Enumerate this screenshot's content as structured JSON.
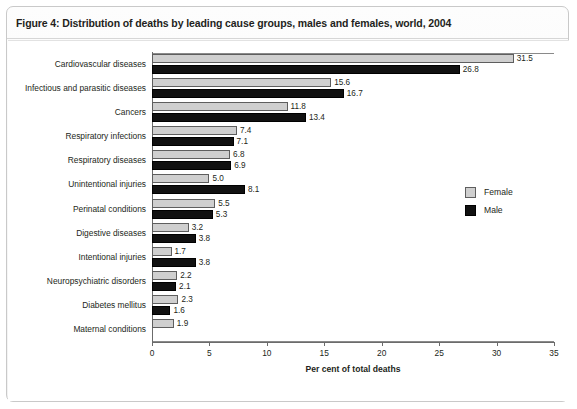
{
  "figure": {
    "title": "Figure 4: Distribution of deaths by leading cause groups, males and females, world, 2004"
  },
  "legend": {
    "items": [
      {
        "label": "Female",
        "key": "female",
        "color": "#cfcfcf"
      },
      {
        "label": "Male",
        "key": "male",
        "color": "#111111"
      }
    ]
  },
  "chart_data": {
    "type": "bar",
    "orientation": "horizontal",
    "title": "Figure 4: Distribution of deaths by leading cause groups, males and females, world, 2004",
    "xlabel": "Per cent of total deaths",
    "ylabel": "",
    "xlim": [
      0,
      35
    ],
    "xticks": [
      0,
      5,
      10,
      15,
      20,
      25,
      30,
      35
    ],
    "xticklabels": [
      "0",
      "5",
      "10",
      "15",
      "20",
      "25",
      "30",
      "35"
    ],
    "grid": false,
    "legend_position": "right-middle",
    "categories": [
      "Cardiovascular diseases",
      "Infectious and parasitic diseases",
      "Cancers",
      "Respiratory infections",
      "Respiratory diseases",
      "Unintentional injuries",
      "Perinatal conditions",
      "Digestive diseases",
      "Intentional injuries",
      "Neuropsychiatric disorders",
      "Diabetes mellitus",
      "Maternal conditions"
    ],
    "series": [
      {
        "name": "Female",
        "color": "#cfcfcf",
        "values": [
          31.5,
          15.6,
          11.8,
          7.4,
          6.8,
          5.0,
          5.5,
          3.2,
          1.7,
          2.2,
          2.3,
          1.9
        ],
        "labels": [
          "31.5",
          "15.6",
          "11.8",
          "7.4",
          "6.8",
          "5.0",
          "5.5",
          "3.2",
          "1.7",
          "2.2",
          "2.3",
          "1.9"
        ]
      },
      {
        "name": "Male",
        "color": "#111111",
        "values": [
          26.8,
          16.7,
          13.4,
          7.1,
          6.9,
          8.1,
          5.3,
          3.8,
          3.8,
          2.1,
          1.6,
          null
        ],
        "labels": [
          "26.8",
          "16.7",
          "13.4",
          "7.1",
          "6.9",
          "8.1",
          "5.3",
          "3.8",
          "3.8",
          "2.1",
          "1.6",
          ""
        ]
      }
    ]
  }
}
